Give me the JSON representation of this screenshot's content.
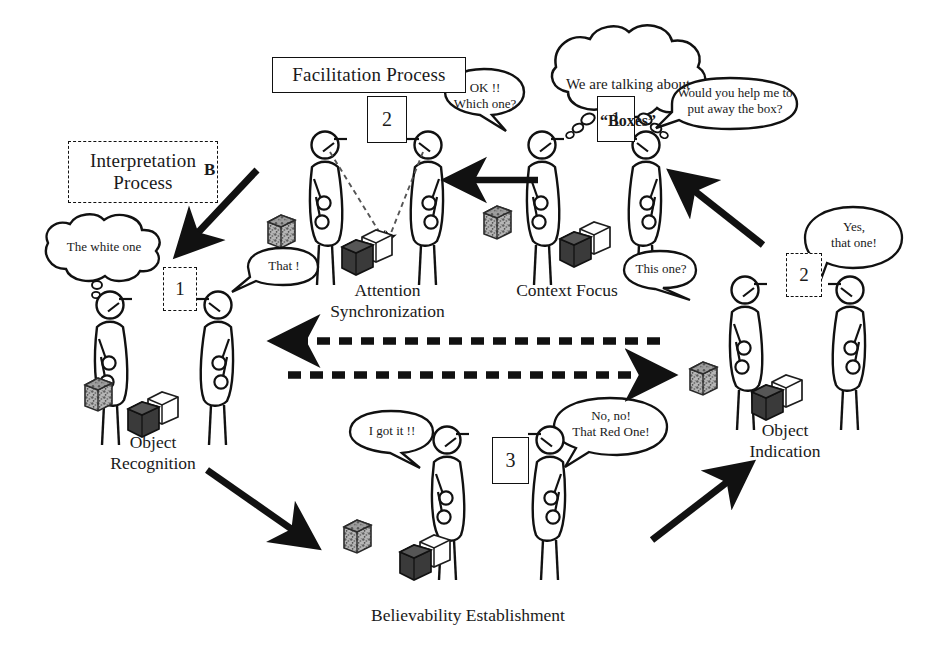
{
  "diagram": {
    "background": "#ffffff",
    "ink": "#111111"
  },
  "panels": [
    {
      "id": "facilitation",
      "label": "Facilitation Process",
      "style": "solid-box"
    },
    {
      "id": "interpretation",
      "label": "Interpretation\nProcess",
      "style": "dashed-box"
    }
  ],
  "flow_letters": [
    {
      "id": "b",
      "label": "B"
    }
  ],
  "stages": [
    {
      "id": "context-focus",
      "label": "Context Focus",
      "step": "1",
      "step_style": "solid"
    },
    {
      "id": "attention-sync",
      "label": "Attention\nSynchronization",
      "step": "2",
      "step_style": "solid"
    },
    {
      "id": "object-recognition",
      "label": "Object\nRecognition",
      "step": "1",
      "step_style": "dashed"
    },
    {
      "id": "object-indication",
      "label": "Object\nIndication",
      "step": "2",
      "step_style": "dashed"
    },
    {
      "id": "believability",
      "label": "Believability Establishment",
      "step": "3",
      "step_style": "solid"
    }
  ],
  "bubbles": [
    {
      "id": "topic-cloud",
      "kind": "thought",
      "line1": "We are talking about",
      "line2": "“Boxes”"
    },
    {
      "id": "ok-which-one",
      "kind": "speech",
      "text": "OK !!\nWhich one?"
    },
    {
      "id": "would-you-help",
      "kind": "speech",
      "text": "Would you help me to\nput away the box?"
    },
    {
      "id": "white-one-cloud",
      "kind": "thought",
      "text": "The white one"
    },
    {
      "id": "that",
      "kind": "speech",
      "text": "That !"
    },
    {
      "id": "this-one",
      "kind": "speech",
      "text": "This one?"
    },
    {
      "id": "yes-that-one",
      "kind": "speech",
      "text": "Yes,\nthat one!"
    },
    {
      "id": "i-got-it",
      "kind": "speech",
      "text": "I got it !!"
    },
    {
      "id": "no-no-red",
      "kind": "speech",
      "text": "No, no!\nThat Red One!"
    }
  ],
  "arrows": [
    {
      "id": "arrow-indication-to-context",
      "style": "solid",
      "direction": "up-right"
    },
    {
      "id": "arrow-context-to-attention",
      "style": "solid",
      "direction": "left"
    },
    {
      "id": "arrow-attention-to-interpretation",
      "style": "solid",
      "direction": "down-left"
    },
    {
      "id": "arrow-recognition-to-believability",
      "style": "solid",
      "direction": "down-right"
    },
    {
      "id": "arrow-believability-to-indication",
      "style": "solid",
      "direction": "up-right"
    },
    {
      "id": "arrow-dashed-left",
      "style": "dashed",
      "direction": "left"
    },
    {
      "id": "arrow-dashed-right",
      "style": "dashed",
      "direction": "right"
    }
  ],
  "objects": [
    {
      "id": "cube-textured",
      "fill": "#8d8d8d",
      "name": "textured-cube"
    },
    {
      "id": "cube-dark",
      "fill": "#3a3a3a",
      "name": "dark-cube"
    },
    {
      "id": "cube-white",
      "fill": "#ffffff",
      "name": "white-cube"
    }
  ]
}
